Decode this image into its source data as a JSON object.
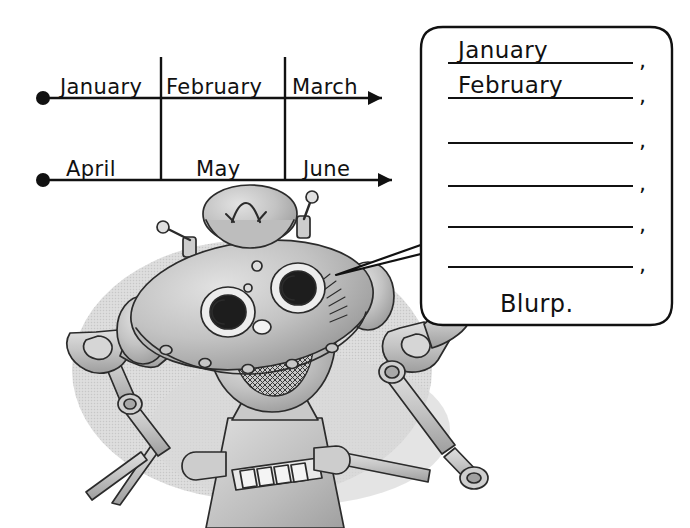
{
  "page": {
    "background_color": "#ffffff",
    "ink_color": "#111111",
    "width": 690,
    "height": 528
  },
  "timelines": [
    {
      "id": "timeline-top",
      "start_marker": "filled-dot",
      "end_marker": "arrowhead",
      "segments": [
        {
          "label": "January"
        },
        {
          "label": "February"
        },
        {
          "label": "March"
        }
      ]
    },
    {
      "id": "timeline-bottom",
      "start_marker": "filled-dot",
      "end_marker": "arrowhead",
      "segments": [
        {
          "label": "April"
        },
        {
          "label": "May"
        },
        {
          "label": "June"
        }
      ]
    }
  ],
  "speech_bubble": {
    "tail_direction": "down-left",
    "answer_lines": [
      {
        "value": "January",
        "punctuation": ","
      },
      {
        "value": "February",
        "punctuation": ","
      },
      {
        "value": "",
        "punctuation": ","
      },
      {
        "value": "",
        "punctuation": ","
      },
      {
        "value": "",
        "punctuation": ","
      },
      {
        "value": "",
        "punctuation": ","
      }
    ],
    "closing_text": "Blurp."
  },
  "robot": {
    "name": "cartoon-robot",
    "colors": {
      "body_light": "#d8d8d8",
      "body_mid": "#b9b9b9",
      "body_dark": "#9a9a9a",
      "shadow": "#d2d2d2",
      "outline": "#2b2b2b"
    },
    "parts": [
      "hat",
      "antenna-left",
      "antenna-right",
      "head",
      "eye-left",
      "eye-right",
      "mouth-grille",
      "ear-left",
      "ear-right",
      "neck",
      "torso",
      "button-panel",
      "arm-left",
      "arm-right",
      "claw-left",
      "claw-right"
    ],
    "button_panel_count": 6
  }
}
